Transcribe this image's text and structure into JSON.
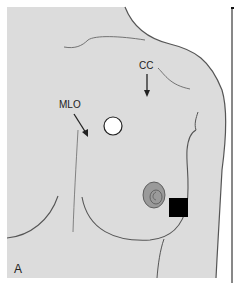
{
  "figure": {
    "panel_label": "A",
    "labels": {
      "cc": "CC",
      "mlo": "MLO"
    },
    "colors": {
      "background": "#ffffff",
      "skin": "#dcdcdc",
      "outline": "#555555",
      "areola": "#9a9a9a",
      "marker_circle": "#ffffff",
      "marker_square": "#000000",
      "divider": "#111111"
    },
    "markers": [
      {
        "shape": "circle",
        "fill": "white",
        "meaning": "marker"
      },
      {
        "shape": "square",
        "fill": "black",
        "meaning": "marker"
      }
    ]
  }
}
